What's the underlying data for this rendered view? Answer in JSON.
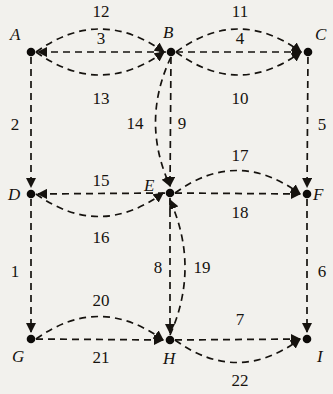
{
  "diagram": {
    "background_color": "#f2f1ed",
    "stroke_color": "#16130f",
    "node_color": "#0d0b09",
    "nodes": [
      {
        "id": "A",
        "label": "A",
        "x": 31,
        "y": 52,
        "label_x": 10,
        "label_y": 40
      },
      {
        "id": "B",
        "label": "B",
        "x": 171,
        "y": 52,
        "label_x": 163,
        "label_y": 38
      },
      {
        "id": "C",
        "label": "C",
        "x": 308,
        "y": 52,
        "label_x": 315,
        "label_y": 40
      },
      {
        "id": "D",
        "label": "D",
        "x": 31,
        "y": 194,
        "label_x": 8,
        "label_y": 200
      },
      {
        "id": "E",
        "label": "E",
        "x": 170,
        "y": 193,
        "label_x": 144,
        "label_y": 191
      },
      {
        "id": "F",
        "label": "F",
        "x": 307,
        "y": 194,
        "label_x": 313,
        "label_y": 200
      },
      {
        "id": "G",
        "label": "G",
        "x": 31,
        "y": 339,
        "label_x": 12,
        "label_y": 362
      },
      {
        "id": "H",
        "label": "H",
        "x": 170,
        "y": 340,
        "label_x": 163,
        "label_y": 364
      },
      {
        "id": "I",
        "label": "I",
        "x": 307,
        "y": 339,
        "label_x": 317,
        "label_y": 362
      }
    ],
    "edges": [
      {
        "id": "e12",
        "label": "12",
        "from": "A",
        "to": "B",
        "shape": "arc-up",
        "label_x": 101,
        "label_y": 17
      },
      {
        "id": "e3",
        "label": "3",
        "from": "B",
        "to": "A",
        "shape": "straight",
        "label_x": 101,
        "label_y": 44
      },
      {
        "id": "e13",
        "label": "13",
        "from": "A",
        "to": "B",
        "shape": "arc-down",
        "label_x": 101,
        "label_y": 104
      },
      {
        "id": "e11",
        "label": "11",
        "from": "B",
        "to": "C",
        "shape": "arc-up",
        "label_x": 240,
        "label_y": 17
      },
      {
        "id": "e4",
        "label": "4",
        "from": "B",
        "to": "C",
        "shape": "straight",
        "label_x": 240,
        "label_y": 44
      },
      {
        "id": "e10",
        "label": "10",
        "from": "B",
        "to": "C",
        "shape": "arc-down",
        "label_x": 240,
        "label_y": 104
      },
      {
        "id": "e2",
        "label": "2",
        "from": "A",
        "to": "D",
        "shape": "vertical",
        "label_x": 15,
        "label_y": 130
      },
      {
        "id": "e5",
        "label": "5",
        "from": "C",
        "to": "F",
        "shape": "vertical",
        "label_x": 322,
        "label_y": 130
      },
      {
        "id": "e14",
        "label": "14",
        "from": "B",
        "to": "E",
        "shape": "arc-left",
        "label_x": 135,
        "label_y": 129
      },
      {
        "id": "e9",
        "label": "9",
        "from": "B",
        "to": "E",
        "shape": "vertical",
        "label_x": 182,
        "label_y": 129
      },
      {
        "id": "e15",
        "label": "15",
        "from": "E",
        "to": "D",
        "shape": "straight",
        "label_x": 101,
        "label_y": 186
      },
      {
        "id": "e16",
        "label": "16",
        "from": "D",
        "to": "E",
        "shape": "arc-down",
        "label_x": 101,
        "label_y": 243
      },
      {
        "id": "e17",
        "label": "17",
        "from": "E",
        "to": "F",
        "shape": "arc-up",
        "label_x": 240,
        "label_y": 161
      },
      {
        "id": "e18",
        "label": "18",
        "from": "E",
        "to": "F",
        "shape": "straight",
        "label_x": 240,
        "label_y": 218
      },
      {
        "id": "e1",
        "label": "1",
        "from": "D",
        "to": "G",
        "shape": "vertical",
        "label_x": 15,
        "label_y": 277
      },
      {
        "id": "e6",
        "label": "6",
        "from": "F",
        "to": "I",
        "shape": "vertical",
        "label_x": 322,
        "label_y": 277
      },
      {
        "id": "e8",
        "label": "8",
        "from": "E",
        "to": "H",
        "shape": "vertical",
        "label_x": 158,
        "label_y": 273
      },
      {
        "id": "e19",
        "label": "19",
        "from": "H",
        "to": "E",
        "shape": "arc-right",
        "label_x": 202,
        "label_y": 273
      },
      {
        "id": "e20",
        "label": "20",
        "from": "G",
        "to": "H",
        "shape": "arc-up",
        "label_x": 101,
        "label_y": 306
      },
      {
        "id": "e21",
        "label": "21",
        "from": "G",
        "to": "H",
        "shape": "straight",
        "label_x": 101,
        "label_y": 363
      },
      {
        "id": "e7",
        "label": "7",
        "from": "H",
        "to": "I",
        "shape": "straight",
        "label_x": 240,
        "label_y": 325
      },
      {
        "id": "e22",
        "label": "22",
        "from": "H",
        "to": "I",
        "shape": "arc-down",
        "label_x": 240,
        "label_y": 386
      }
    ]
  }
}
